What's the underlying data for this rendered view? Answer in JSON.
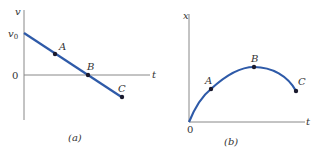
{
  "panels": [
    {
      "caption": "(a)",
      "y_axis_label": "v",
      "x_axis_label": "t",
      "origin_label": "0",
      "intercept_label": "v0",
      "intercept_base": "v",
      "intercept_sub": "0",
      "points": [
        {
          "label": "A"
        },
        {
          "label": "B"
        },
        {
          "label": "C"
        }
      ]
    },
    {
      "caption": "(b)",
      "y_axis_label": "x",
      "x_axis_label": "t",
      "origin_label": "0",
      "points": [
        {
          "label": "A"
        },
        {
          "label": "B"
        },
        {
          "label": "C"
        }
      ]
    }
  ],
  "colors": {
    "curve": "#2e5aa8",
    "axis": "#888888",
    "point": "#1a1a2e"
  }
}
